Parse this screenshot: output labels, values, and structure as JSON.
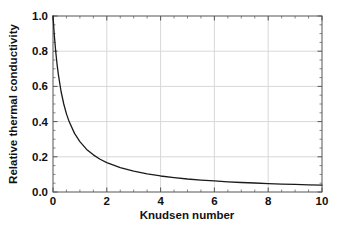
{
  "chart_data": {
    "type": "line",
    "title": "",
    "xlabel": "Knudsen number",
    "ylabel": "Relative thermal conductivity",
    "xlim": [
      0,
      10
    ],
    "ylim": [
      0,
      1.0
    ],
    "grid": true,
    "legend": false,
    "xticks": [
      "0",
      "2",
      "4",
      "6",
      "8",
      "10"
    ],
    "xtick_values": [
      0,
      2,
      4,
      6,
      8,
      10
    ],
    "yticks": [
      "0.0",
      "0.2",
      "0.4",
      "0.6",
      "0.8",
      "1.0"
    ],
    "ytick_values": [
      0.0,
      0.2,
      0.4,
      0.6,
      0.8,
      1.0
    ],
    "minor_ticks": true,
    "line_color": "#1a1a1a",
    "grid_color": "#d8d8d8",
    "axis_color": "#555555",
    "background_color": "#ffffff",
    "series": [
      {
        "name": "Relative thermal conductivity",
        "formula": "1 / (1 + 2.5 * Kn)",
        "x": [
          0.0,
          0.05,
          0.1,
          0.15,
          0.2,
          0.3,
          0.4,
          0.5,
          0.6,
          0.8,
          1.0,
          1.25,
          1.5,
          1.75,
          2.0,
          2.5,
          3.0,
          3.5,
          4.0,
          4.5,
          5.0,
          5.5,
          6.0,
          6.5,
          7.0,
          7.5,
          8.0,
          8.5,
          9.0,
          9.5,
          10.0
        ],
        "y": [
          1.0,
          0.889,
          0.8,
          0.727,
          0.667,
          0.571,
          0.5,
          0.444,
          0.4,
          0.333,
          0.286,
          0.242,
          0.211,
          0.186,
          0.167,
          0.138,
          0.118,
          0.103,
          0.091,
          0.082,
          0.074,
          0.068,
          0.063,
          0.058,
          0.054,
          0.051,
          0.048,
          0.045,
          0.043,
          0.041,
          0.039
        ]
      }
    ]
  }
}
